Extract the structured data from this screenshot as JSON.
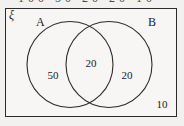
{
  "figure": {
    "type": "venn-diagram",
    "universal_set_symbol": "ξ",
    "clipped_header_text": "100  50   20   20   10",
    "set_labels": {
      "left": "A",
      "right": "B"
    },
    "regions": [
      {
        "name": "a-only",
        "label": "50"
      },
      {
        "name": "intersection",
        "label": "20"
      },
      {
        "name": "b-only",
        "label": "20"
      },
      {
        "name": "outside",
        "label": "10"
      }
    ],
    "colors": {
      "stroke": "#2b2b2b",
      "background": "#f7f6f4",
      "page": "#f2f1ef",
      "text": "#1b1b1b"
    }
  }
}
